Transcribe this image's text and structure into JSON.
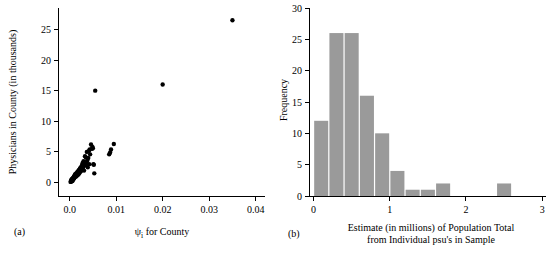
{
  "figure": {
    "panels": [
      {
        "tag": "(a)",
        "name": "scatter-physicians-vs-psi"
      },
      {
        "tag": "(b)",
        "name": "histogram-population-total-estimates"
      }
    ]
  },
  "chart_data": [
    {
      "type": "scatter",
      "panel": "(a)",
      "title": "",
      "xlabel": "ψi for County",
      "xlabel_base": "ψ",
      "xlabel_subscript": "i",
      "xlabel_rest": " for County",
      "ylabel": "Physicians in County (in thousands)",
      "xlim": [
        -0.0025,
        0.042
      ],
      "ylim": [
        -2.2,
        28.5
      ],
      "xticks": [
        0.0,
        0.01,
        0.02,
        0.03,
        0.04
      ],
      "xticklabels": [
        "0.0",
        "0.01",
        "0.02",
        "0.03",
        "0.04"
      ],
      "yticks": [
        0,
        5,
        10,
        15,
        20,
        25
      ],
      "yticklabels": [
        "0",
        "5",
        "10",
        "15",
        "20",
        "25"
      ],
      "grid": false,
      "legend": "none",
      "marker": "filled-circle",
      "marker_color": "#000000",
      "points": [
        [
          0.0002,
          0.1
        ],
        [
          0.0003,
          0.15
        ],
        [
          0.0003,
          0.3
        ],
        [
          0.0004,
          0.2
        ],
        [
          0.0004,
          0.45
        ],
        [
          0.0005,
          0.35
        ],
        [
          0.0005,
          0.6
        ],
        [
          0.0006,
          0.25
        ],
        [
          0.0006,
          0.5
        ],
        [
          0.0007,
          0.7
        ],
        [
          0.0007,
          0.4
        ],
        [
          0.0008,
          0.8
        ],
        [
          0.0008,
          0.55
        ],
        [
          0.0009,
          0.95
        ],
        [
          0.0009,
          0.65
        ],
        [
          0.001,
          1.05
        ],
        [
          0.001,
          0.75
        ],
        [
          0.0011,
          1.2
        ],
        [
          0.0012,
          0.9
        ],
        [
          0.0012,
          1.35
        ],
        [
          0.0013,
          1.1
        ],
        [
          0.0014,
          1.5
        ],
        [
          0.0014,
          1.0
        ],
        [
          0.0015,
          1.25
        ],
        [
          0.0016,
          1.6
        ],
        [
          0.0016,
          1.15
        ],
        [
          0.0017,
          1.75
        ],
        [
          0.0018,
          1.4
        ],
        [
          0.0019,
          1.9
        ],
        [
          0.0019,
          1.3
        ],
        [
          0.002,
          2.05
        ],
        [
          0.0021,
          1.55
        ],
        [
          0.0022,
          2.2
        ],
        [
          0.0022,
          1.7
        ],
        [
          0.0023,
          2.4
        ],
        [
          0.0024,
          1.85
        ],
        [
          0.0025,
          2.6
        ],
        [
          0.0026,
          2.0
        ],
        [
          0.0027,
          2.9
        ],
        [
          0.0027,
          2.25
        ],
        [
          0.0028,
          3.2
        ],
        [
          0.0029,
          2.45
        ],
        [
          0.003,
          3.5
        ],
        [
          0.003,
          2.7
        ],
        [
          0.0031,
          1.95
        ],
        [
          0.0032,
          3.1
        ],
        [
          0.0033,
          4.3
        ],
        [
          0.0034,
          2.85
        ],
        [
          0.0035,
          4.1
        ],
        [
          0.0036,
          3.3
        ],
        [
          0.0037,
          5.0
        ],
        [
          0.0038,
          3.6
        ],
        [
          0.0039,
          2.5
        ],
        [
          0.004,
          4.0
        ],
        [
          0.0041,
          5.1
        ],
        [
          0.0042,
          3.0
        ],
        [
          0.0043,
          5.4
        ],
        [
          0.0044,
          4.6
        ],
        [
          0.0046,
          6.2
        ],
        [
          0.0048,
          5.5
        ],
        [
          0.0049,
          5.8
        ],
        [
          0.005,
          5.6
        ],
        [
          0.0051,
          3.0
        ],
        [
          0.0052,
          2.9
        ],
        [
          0.0053,
          1.5
        ],
        [
          0.0055,
          15.0
        ],
        [
          0.0085,
          4.6
        ],
        [
          0.0087,
          4.9
        ],
        [
          0.0089,
          5.4
        ],
        [
          0.0095,
          6.3
        ],
        [
          0.02,
          16.0
        ],
        [
          0.035,
          26.5
        ]
      ]
    },
    {
      "type": "bar",
      "histogram": true,
      "panel": "(b)",
      "title": "",
      "xlabel_line1": "Estimate (in millions) of Population Total",
      "xlabel_line2": "from Individual psu's in Sample",
      "ylabel": "Frequency",
      "xlim": [
        -0.06,
        3.05
      ],
      "ylim": [
        0,
        30
      ],
      "xticks": [
        0,
        1,
        2,
        3
      ],
      "xticklabels": [
        "0",
        "1",
        "2",
        "3"
      ],
      "yticks": [
        0,
        5,
        10,
        15,
        20,
        25,
        30
      ],
      "yticklabels": [
        "0",
        "5",
        "10",
        "15",
        "20",
        "25",
        "30"
      ],
      "grid": false,
      "legend": "none",
      "bin_width": 0.2,
      "bar_color": "#9a9a9a",
      "bin_edges": [
        0.0,
        0.2,
        0.4,
        0.6,
        0.8,
        1.0,
        1.2,
        1.4,
        1.6,
        1.8,
        2.0,
        2.2,
        2.4,
        2.6
      ],
      "categories": [
        "0.0-0.2",
        "0.2-0.4",
        "0.4-0.6",
        "0.6-0.8",
        "0.8-1.0",
        "1.0-1.2",
        "1.2-1.4",
        "1.4-1.6",
        "1.6-1.8",
        "1.8-2.0",
        "2.0-2.2",
        "2.2-2.4",
        "2.4-2.6"
      ],
      "values": [
        12,
        26,
        26,
        16,
        10,
        4,
        1,
        1,
        2,
        0,
        0,
        0,
        2
      ]
    }
  ]
}
